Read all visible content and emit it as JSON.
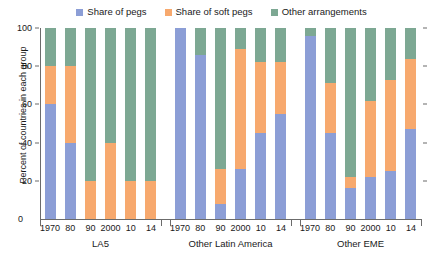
{
  "chart_data": {
    "type": "bar",
    "subtype": "stacked-percent",
    "title": "",
    "xlabel": "",
    "ylabel": "Percent of countries in each group",
    "ylim": [
      0,
      100
    ],
    "yticks": [
      0,
      20,
      40,
      60,
      80,
      100
    ],
    "grid": false,
    "legend_position": "top-center",
    "colors": {
      "pegs": "#8c9ed6",
      "soft_pegs": "#f7a96e",
      "other": "#7da893"
    },
    "legend": [
      {
        "label": "Share of pegs",
        "color": "#8c9ed6"
      },
      {
        "label": "Share of soft pegs",
        "color": "#f7a96e"
      },
      {
        "label": "Other arrangements",
        "color": "#7da893"
      }
    ],
    "series": [
      {
        "name": "Share of pegs",
        "key": "pegs",
        "color": "#8c9ed6"
      },
      {
        "name": "Share of soft pegs",
        "key": "soft_pegs",
        "color": "#f7a96e"
      },
      {
        "name": "Other arrangements",
        "key": "other",
        "color": "#7da893"
      }
    ],
    "categories": [
      "1970",
      "80",
      "90",
      "2000",
      "10",
      "14"
    ],
    "groups": [
      {
        "name": "LA5",
        "x": [
          "1970",
          "80",
          "90",
          "2000",
          "10",
          "14"
        ],
        "values": {
          "pegs": [
            60,
            40,
            0,
            0,
            0,
            0
          ],
          "soft_pegs": [
            20,
            40,
            20,
            40,
            20,
            20
          ],
          "other": [
            20,
            20,
            80,
            60,
            80,
            80
          ]
        }
      },
      {
        "name": "Other Latin America",
        "x": [
          "1970",
          "80",
          "90",
          "2000",
          "10",
          "14"
        ],
        "values": {
          "pegs": [
            100,
            86,
            8,
            26,
            45,
            55
          ],
          "soft_pegs": [
            0,
            0,
            18,
            63,
            37,
            27
          ],
          "other": [
            0,
            14,
            74,
            11,
            18,
            18
          ]
        }
      },
      {
        "name": "Other EME",
        "x": [
          "1970",
          "80",
          "90",
          "2000",
          "10",
          "14"
        ],
        "values": {
          "pegs": [
            96,
            45,
            16,
            22,
            25,
            47
          ],
          "soft_pegs": [
            0,
            26,
            6,
            40,
            48,
            37
          ],
          "other": [
            4,
            29,
            78,
            38,
            27,
            16
          ]
        }
      }
    ],
    "zero_label": "0"
  }
}
